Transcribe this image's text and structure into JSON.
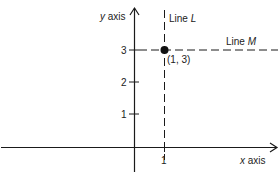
{
  "diagram": {
    "axes": {
      "x_label_var": "x",
      "x_label_word": "axis",
      "y_label_var": "y",
      "y_label_word": "axis"
    },
    "x_ticks": [
      {
        "value": 1,
        "label": "1"
      }
    ],
    "y_ticks": [
      {
        "value": 1,
        "label": "1"
      },
      {
        "value": 2,
        "label": "2"
      },
      {
        "value": 3,
        "label": "3"
      }
    ],
    "lines": [
      {
        "name": "Line",
        "var": "L",
        "type": "vertical",
        "x": 1,
        "style": "dashed"
      },
      {
        "name": "Line",
        "var": "M",
        "type": "horizontal",
        "y": 3,
        "style": "dashed"
      }
    ],
    "point": {
      "x": 1,
      "y": 3,
      "label": "(1, 3)"
    },
    "colors": {
      "ink": "#1a1a1a",
      "background": "#ffffff"
    }
  }
}
